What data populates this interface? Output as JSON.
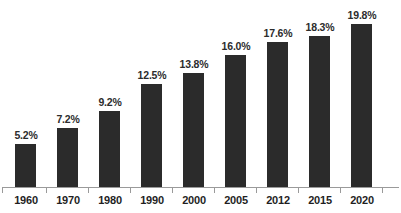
{
  "chart_data": {
    "type": "bar",
    "title": "",
    "xlabel": "",
    "ylabel": "",
    "ylim": [
      0,
      22.7
    ],
    "grid": false,
    "legend": null,
    "value_suffix": "%",
    "categories": [
      "1960",
      "1970",
      "1980",
      "1990",
      "2000",
      "2005",
      "2012",
      "2015",
      "2020"
    ],
    "values": [
      5.2,
      7.2,
      9.2,
      12.5,
      13.8,
      16.0,
      17.6,
      18.3,
      19.8
    ],
    "data_labels": [
      "5.2%",
      "7.2%",
      "9.2%",
      "12.5%",
      "13.8%",
      "16.0%",
      "17.6%",
      "18.3%",
      "19.8%"
    ],
    "colors": {
      "bar": "#2b2b2b",
      "background": "#ffffff",
      "axis": "#9a9a9a",
      "value_label": "#2c2c2c",
      "category_label": "#1f1f1f"
    }
  },
  "title_remnant": {
    "text": ""
  }
}
